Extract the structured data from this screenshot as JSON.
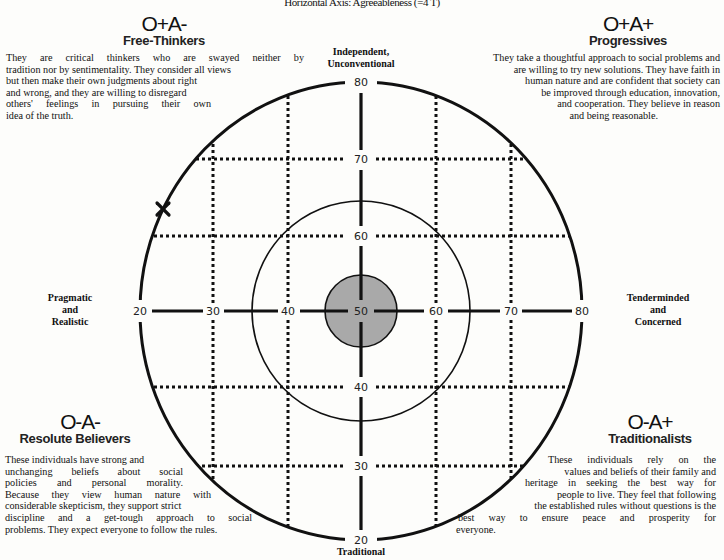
{
  "header": {
    "axis_title": "Horizontal Axis: Agreeableness (=4 T)"
  },
  "poles": {
    "top": [
      "Independent,",
      "Unconventional"
    ],
    "bottom": [
      "Traditional"
    ],
    "left": [
      "Pragmatic",
      "and",
      "Realistic"
    ],
    "right": [
      "Tenderminded",
      "and",
      "Concerned"
    ]
  },
  "quadrants": {
    "top_left": {
      "code": "O+A-",
      "name": "Free-Thinkers",
      "lines": [
        "They are critical thinkers who are swayed neither by",
        "tradition nor by sentimentality. They consider all views",
        "but then make their own judgments about right",
        "and wrong, and they are willing to disregard",
        "others' feelings in pursuing their own",
        "idea of the truth."
      ]
    },
    "top_right": {
      "code": "O+A+",
      "name": "Progressives",
      "lines": [
        "They take a thoughtful approach to social problems and",
        "are willing to try new solutions.  They have faith in",
        "human nature and are confident that society can",
        "be improved through education, innovation,",
        "and cooperation. They believe in reason",
        "and being reasonable."
      ]
    },
    "bottom_left": {
      "code": "O-A-",
      "name": "Resolute Believers",
      "lines": [
        "These individuals have strong and",
        "unchanging beliefs about social",
        "policies and personal morality.",
        "Because they view human nature with",
        "considerable skepticism, they support strict",
        "discipline and a get-tough approach to social",
        "problems. They expect everyone to follow the rules."
      ]
    },
    "bottom_right": {
      "code": "O-A+",
      "name": "Traditionalists",
      "lines": [
        "These individuals rely on the",
        "values and beliefs of their family and",
        "heritage in seeking the best way for",
        "people to live. They feel that following",
        "the established rules without questions is the",
        "best way to ensure peace and prosperity for",
        "everyone."
      ]
    }
  },
  "axes": {
    "horizontal_ticks": [
      "20",
      "30",
      "40",
      "50",
      "60",
      "70",
      "80"
    ],
    "vertical_ticks_top_down": [
      "80",
      "70",
      "60",
      "50",
      "40",
      "30",
      "20"
    ]
  },
  "marker": {
    "symbol": "X",
    "position_note": "on outer circle, upper-left quadrant"
  },
  "colors": {
    "ink": "#111111",
    "center_fill": "#a9a9a9",
    "background": "#fdfdfb"
  }
}
